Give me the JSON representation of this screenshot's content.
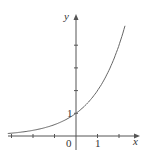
{
  "chart_data": {
    "type": "line",
    "title": "",
    "xlabel": "x",
    "ylabel": "y",
    "function": "y = 2^x",
    "x": [
      -3.1,
      -3,
      -2,
      -1,
      0,
      1,
      2,
      2.3
    ],
    "values": [
      0.117,
      0.125,
      0.25,
      0.5,
      1,
      2,
      4,
      4.92
    ],
    "xlim": [
      -3.1,
      3
    ],
    "ylim": [
      -0.6,
      5.3
    ],
    "x_ticks": [
      -3,
      -2,
      -1,
      1,
      2
    ],
    "y_ticks": [
      1,
      2,
      3,
      4
    ],
    "tick_labels": {
      "origin": "0",
      "x_one": "1",
      "y_one": "1"
    },
    "grid": false,
    "legend": null
  },
  "labels": {
    "x_axis": "x",
    "y_axis": "y",
    "origin": "0",
    "x_one": "1",
    "y_one": "1"
  },
  "colors": {
    "axis": "#555555",
    "curve": "#666666",
    "text": "#333333"
  }
}
